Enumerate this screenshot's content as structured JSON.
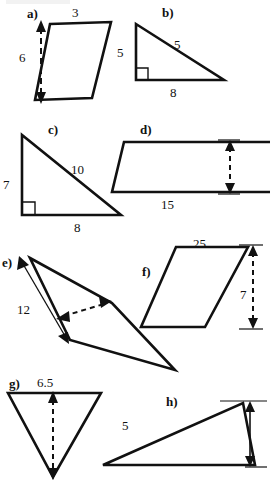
{
  "page": {
    "background_color": "#ffffff",
    "stroke_color": "#111111",
    "width": 270,
    "height": 481
  },
  "figures": [
    {
      "id": "a",
      "label": "a)",
      "shape": "parallelogram",
      "labels": {
        "top": "3",
        "height": "6"
      }
    },
    {
      "id": "b",
      "label": "b)",
      "shape": "right-triangle",
      "labels": {
        "left": "5",
        "hypotenuse": "5",
        "base": "8"
      }
    },
    {
      "id": "c",
      "label": "c)",
      "shape": "right-triangle",
      "labels": {
        "left": "7",
        "hypotenuse": "10",
        "base": "8"
      }
    },
    {
      "id": "d",
      "label": "d)",
      "shape": "parallelogram",
      "labels": {
        "height": "5",
        "base": "15"
      }
    },
    {
      "id": "e",
      "label": "e)",
      "shape": "thin-parallelogram",
      "labels": {
        "side": "12",
        "height": "3"
      }
    },
    {
      "id": "f",
      "label": "f)",
      "shape": "parallelogram",
      "labels": {
        "top": "25",
        "height": "7"
      }
    },
    {
      "id": "g",
      "label": "g)",
      "shape": "inverted-triangle",
      "labels": {
        "base": "6.5",
        "height": "6"
      }
    },
    {
      "id": "h",
      "label": "h)",
      "shape": "triangle",
      "labels": {
        "side": "5",
        "height_whole": "3",
        "height_numerator": "1",
        "height_denominator": "2"
      }
    }
  ]
}
